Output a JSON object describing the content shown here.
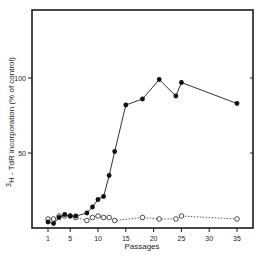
{
  "chart_data": {
    "type": "line",
    "title": "",
    "xlabel": "Passages",
    "ylabel": "3H-TdR incorporation (% of control)",
    "ylabel_parts": {
      "sup": "3",
      "main": "H - TdR incorporation   (% of control)"
    },
    "xlim": [
      0,
      38
    ],
    "ylim": [
      0,
      145
    ],
    "x_ticks": [
      1,
      5,
      10,
      15,
      20,
      25,
      30,
      35
    ],
    "y_ticks": [
      50,
      100
    ],
    "grid": false,
    "legend": null,
    "series": [
      {
        "name": "filled circles",
        "marker": "filled-circle",
        "line": "solid",
        "points": [
          [
            1,
            4
          ],
          [
            2,
            3
          ],
          [
            3,
            7
          ],
          [
            4,
            9
          ],
          [
            5,
            8
          ],
          [
            6,
            8
          ],
          [
            8,
            10
          ],
          [
            9,
            14
          ],
          [
            10,
            19
          ],
          [
            11,
            21
          ],
          [
            12,
            35
          ],
          [
            13,
            51
          ],
          [
            15,
            82
          ],
          [
            18,
            86
          ],
          [
            21,
            99
          ],
          [
            24,
            88
          ],
          [
            25,
            97
          ],
          [
            35,
            83
          ]
        ]
      },
      {
        "name": "open circles",
        "marker": "open-circle",
        "line": "dotted",
        "points": [
          [
            1,
            6
          ],
          [
            2,
            6
          ],
          [
            3,
            8
          ],
          [
            4,
            8
          ],
          [
            5,
            8
          ],
          [
            6,
            7
          ],
          [
            8,
            5
          ],
          [
            9,
            7
          ],
          [
            10,
            8
          ],
          [
            11,
            7
          ],
          [
            12,
            7
          ],
          [
            13,
            5
          ],
          [
            18,
            7
          ],
          [
            21,
            6
          ],
          [
            24,
            6
          ],
          [
            25,
            8
          ],
          [
            35,
            6
          ]
        ]
      }
    ]
  }
}
